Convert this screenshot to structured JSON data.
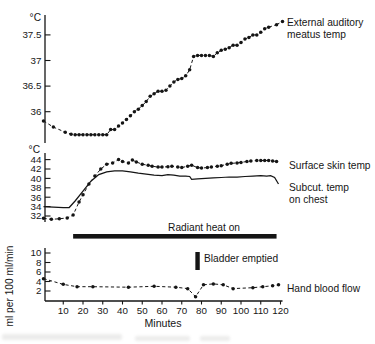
{
  "colors": {
    "ink": "#151515",
    "background": "#ffffff"
  },
  "chart_data": [
    {
      "type": "line",
      "panel": "external-auditory-meatus-temp",
      "ylabel": "°C",
      "yticks": [
        37.5,
        37,
        36.5,
        36
      ],
      "ytick_labels": [
        "37.5",
        "37",
        "36.5",
        "36"
      ],
      "ylim": [
        35.3,
        37.9
      ],
      "xlim": [
        0,
        120
      ],
      "grid": false,
      "series": [
        {
          "name": "External auditory meatus temp",
          "label_lines": [
            "External auditory",
            "meatus temp"
          ],
          "style": "dashed-markers",
          "x": [
            0,
            5,
            11,
            14,
            16,
            18,
            20,
            22,
            24,
            26,
            28,
            30,
            32,
            34,
            36,
            38,
            40,
            42,
            44,
            46,
            48,
            50,
            52,
            54,
            56,
            58,
            60,
            62,
            64,
            66,
            68,
            70,
            72,
            74,
            76,
            78,
            80,
            82,
            84,
            86,
            88,
            90,
            92,
            94,
            96,
            98,
            100,
            102,
            104,
            106,
            108,
            110,
            112,
            114,
            118
          ],
          "y": [
            35.82,
            35.7,
            35.6,
            35.56,
            35.55,
            35.55,
            35.55,
            35.55,
            35.55,
            35.55,
            35.55,
            35.55,
            35.55,
            35.65,
            35.65,
            35.72,
            35.78,
            35.85,
            35.92,
            36.0,
            36.05,
            36.12,
            36.2,
            36.3,
            36.35,
            36.4,
            36.4,
            36.42,
            36.5,
            36.58,
            36.63,
            36.65,
            36.7,
            36.82,
            37.08,
            37.1,
            37.1,
            37.1,
            37.1,
            37.08,
            37.15,
            37.2,
            37.22,
            37.25,
            37.3,
            37.3,
            37.35,
            37.42,
            37.45,
            37.5,
            37.5,
            37.55,
            37.62,
            37.65,
            37.7
          ]
        }
      ]
    },
    {
      "type": "line",
      "panel": "skin-and-subcutaneous-temp",
      "ylabel": "°C",
      "yticks": [
        44,
        42,
        40,
        38,
        36,
        34,
        32
      ],
      "ytick_labels": [
        "44",
        "42",
        "40",
        "38",
        "36",
        "34",
        "32"
      ],
      "ylim": [
        31,
        45
      ],
      "xlim": [
        0,
        120
      ],
      "grid": false,
      "series": [
        {
          "name": "Surface skin temp",
          "label_lines": [
            "Surface skin temp"
          ],
          "style": "dashed-markers",
          "x": [
            0,
            4,
            8,
            12,
            15,
            18,
            20,
            23,
            26,
            29,
            32,
            35,
            38,
            40,
            43,
            45,
            47,
            50,
            53,
            55,
            58,
            60,
            63,
            65,
            68,
            70,
            73,
            75,
            78,
            80,
            83,
            85,
            88,
            90,
            93,
            95,
            98,
            100,
            103,
            105,
            108,
            110,
            112,
            114,
            116,
            118
          ],
          "y": [
            31.5,
            31.3,
            31.4,
            31.6,
            32.2,
            35.0,
            36.5,
            38.8,
            40.5,
            42.0,
            43.0,
            43.3,
            44.0,
            43.6,
            43.3,
            43.9,
            43.5,
            43.0,
            42.8,
            42.6,
            42.4,
            42.4,
            42.5,
            42.6,
            42.4,
            42.3,
            42.6,
            42.8,
            42.3,
            42.2,
            42.3,
            42.4,
            42.6,
            42.7,
            43.0,
            43.2,
            43.3,
            43.4,
            43.6,
            43.7,
            43.8,
            43.8,
            43.8,
            43.8,
            43.7,
            43.6
          ]
        },
        {
          "name": "Subcut. temp on chest",
          "label_lines": [
            "Subcut. temp",
            "on chest"
          ],
          "style": "solid",
          "x": [
            0,
            5,
            10,
            13,
            16,
            20,
            24,
            28,
            32,
            36,
            40,
            44,
            48,
            52,
            56,
            60,
            63,
            66,
            69,
            72,
            74,
            75,
            78,
            82,
            86,
            90,
            94,
            98,
            102,
            106,
            110,
            113,
            115,
            117,
            119
          ],
          "y": [
            34.0,
            33.9,
            33.8,
            33.8,
            35.2,
            37.3,
            39.4,
            40.8,
            41.4,
            41.6,
            41.6,
            41.4,
            41.1,
            40.9,
            40.7,
            40.6,
            40.8,
            40.7,
            40.5,
            40.5,
            40.4,
            39.8,
            39.9,
            40.0,
            40.1,
            40.2,
            40.3,
            40.3,
            40.4,
            40.5,
            40.6,
            40.5,
            40.6,
            40.2,
            38.8
          ]
        }
      ]
    },
    {
      "type": "line",
      "panel": "hand-blood-flow",
      "ylabel": "ml per 100 ml/min",
      "yticks": [
        10,
        8,
        6,
        4,
        2
      ],
      "ytick_labels": [
        "10",
        "8",
        "6",
        "4",
        "2"
      ],
      "ylim": [
        0,
        11
      ],
      "xlim": [
        0,
        120
      ],
      "xticks": [
        10,
        20,
        30,
        40,
        50,
        60,
        70,
        80,
        90,
        100,
        110,
        120
      ],
      "xlabel": "Minutes",
      "grid": false,
      "series": [
        {
          "name": "Hand blood flow",
          "label_lines": [
            "Hand blood flow"
          ],
          "style": "dashed-markers",
          "x": [
            0,
            10,
            17,
            25,
            43,
            56,
            67,
            73,
            77,
            81,
            86,
            91,
            96,
            106,
            111,
            116,
            119
          ],
          "y": [
            4.6,
            3.4,
            2.9,
            2.9,
            2.8,
            3.0,
            2.8,
            2.5,
            0.8,
            3.3,
            3.5,
            3.3,
            2.5,
            2.7,
            2.9,
            3.1,
            3.3
          ]
        }
      ]
    }
  ],
  "annotations": {
    "radiant_heat": {
      "label": "Radiant heat on",
      "t_start": 15,
      "t_end": 118
    },
    "bladder_emptied": {
      "label": "Bladder emptied",
      "t": 78
    }
  }
}
